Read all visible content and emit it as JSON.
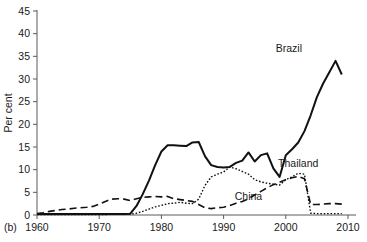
{
  "figure": {
    "panel_label": "(b)",
    "background": "#ffffff",
    "line_color": "#111111",
    "axis_color": "#5a5a5a"
  },
  "chart_data": {
    "type": "line",
    "title": "",
    "xlabel": "",
    "ylabel": "Per cent",
    "xlim": [
      1960,
      2010
    ],
    "ylim": [
      0,
      45
    ],
    "grid": false,
    "legend": "inline-annotations",
    "xticks": [
      1960,
      1970,
      1980,
      1990,
      2000,
      2010
    ],
    "xtick_labels": [
      "1960",
      "1970",
      "1980",
      "1990",
      "2000",
      "2010"
    ],
    "yticks": [
      0,
      5,
      10,
      15,
      20,
      25,
      30,
      35,
      40,
      45
    ],
    "ytick_labels": [
      "0",
      "5",
      "10",
      "15",
      "20",
      "25",
      "30",
      "35",
      "40",
      "45"
    ],
    "annotations": [
      {
        "text": "Brazil",
        "x": 2000.5,
        "y": 36.0
      },
      {
        "text": "Thailand",
        "x": 2002.0,
        "y": 10.5
      },
      {
        "text": "China",
        "x": 1994.0,
        "y": 3.2
      }
    ],
    "series": [
      {
        "name": "Brazil",
        "style": "solid",
        "x": [
          1960,
          1961,
          1962,
          1963,
          1964,
          1965,
          1966,
          1967,
          1968,
          1969,
          1970,
          1971,
          1972,
          1973,
          1974,
          1975,
          1976,
          1977,
          1978,
          1979,
          1980,
          1981,
          1982,
          1983,
          1984,
          1985,
          1986,
          1987,
          1988,
          1989,
          1990,
          1991,
          1992,
          1993,
          1994,
          1995,
          1996,
          1997,
          1998,
          1999,
          2000,
          2001,
          2002,
          2003,
          2004,
          2005,
          2006,
          2007,
          2008,
          2009
        ],
        "values": [
          0.2,
          0.2,
          0.2,
          0.2,
          0.2,
          0.2,
          0.2,
          0.2,
          0.2,
          0.2,
          0.2,
          0.2,
          0.2,
          0.2,
          0.2,
          0.3,
          2.0,
          4.6,
          7.6,
          11.0,
          14.0,
          15.4,
          15.4,
          15.3,
          15.2,
          16.0,
          16.1,
          13.0,
          11.0,
          10.6,
          10.5,
          10.6,
          11.5,
          12.0,
          13.8,
          11.8,
          13.2,
          13.6,
          10.3,
          8.4,
          13.2,
          14.5,
          16.0,
          18.5,
          22.0,
          26.0,
          29.0,
          31.5,
          34.0,
          31.0
        ]
      },
      {
        "name": "Thailand",
        "style": "dotted",
        "x": [
          1960,
          1965,
          1970,
          1975,
          1976,
          1977,
          1978,
          1979,
          1980,
          1981,
          1982,
          1983,
          1984,
          1985,
          1986,
          1987,
          1988,
          1989,
          1990,
          1991,
          1992,
          1993,
          1994,
          1995,
          1996,
          1997,
          1998,
          1999,
          2000,
          2001,
          2002,
          2003,
          2004,
          2005,
          2006,
          2007,
          2008,
          2009
        ],
        "values": [
          0.1,
          0.1,
          0.1,
          0.2,
          0.4,
          0.8,
          1.3,
          1.8,
          2.1,
          2.5,
          2.6,
          2.8,
          2.6,
          2.5,
          3.5,
          6.5,
          8.4,
          9.0,
          9.5,
          10.6,
          10.2,
          9.6,
          9.0,
          7.8,
          7.3,
          7.0,
          6.8,
          6.6,
          7.8,
          8.4,
          9.2,
          9.0,
          0.4,
          0.3,
          0.3,
          0.3,
          0.3,
          0.3
        ]
      },
      {
        "name": "China",
        "style": "dashed",
        "x": [
          1960,
          1961,
          1962,
          1963,
          1964,
          1965,
          1966,
          1967,
          1968,
          1969,
          1970,
          1971,
          1972,
          1973,
          1974,
          1975,
          1976,
          1977,
          1978,
          1979,
          1980,
          1981,
          1982,
          1983,
          1984,
          1985,
          1986,
          1987,
          1988,
          1989,
          1990,
          1991,
          1992,
          1993,
          1994,
          1995,
          1996,
          1997,
          1998,
          1999,
          2000,
          2001,
          2002,
          2003,
          2004,
          2005,
          2006,
          2007,
          2008,
          2009
        ],
        "values": [
          0.3,
          0.5,
          0.8,
          1.0,
          1.2,
          1.3,
          1.5,
          1.6,
          1.7,
          1.9,
          2.4,
          3.0,
          3.5,
          3.6,
          3.5,
          3.2,
          3.6,
          3.9,
          4.0,
          4.1,
          4.0,
          4.1,
          3.6,
          3.4,
          3.2,
          3.0,
          2.3,
          1.6,
          1.4,
          1.6,
          1.7,
          2.1,
          2.6,
          3.0,
          3.6,
          4.4,
          5.2,
          6.0,
          6.7,
          7.2,
          7.8,
          8.2,
          8.5,
          8.0,
          2.3,
          2.3,
          2.4,
          2.5,
          2.5,
          2.4
        ]
      }
    ]
  }
}
